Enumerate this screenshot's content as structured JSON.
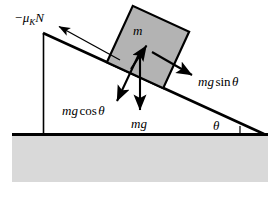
{
  "figure": {
    "type": "physics-force-diagram"
  },
  "labels": {
    "friction": {
      "minus": "−",
      "mu": "μ",
      "subscript": "K",
      "normal": "N",
      "full": "−μₖN"
    },
    "mass": "m",
    "mg_sin": {
      "mg": "mg",
      "sin": "sin",
      "theta": "θ",
      "full": "mg sin θ"
    },
    "mg_cos": {
      "mg": "mg",
      "cos": "cos",
      "theta": "θ",
      "full": "mg cos θ"
    },
    "weight": "mg",
    "angle": "θ"
  },
  "colors": {
    "stroke": "#000000",
    "block_fill": "#b3b3b3",
    "ground_fill": "#d9d9d9",
    "background": "#ffffff"
  },
  "geometry": {
    "incline_apex": [
      43,
      33
    ],
    "incline_base": [
      262,
      134
    ],
    "ground_line_y": 134,
    "ground_left_x": 12,
    "ground_right_x": 268,
    "ground_bottom_y": 182,
    "support_x": 43,
    "block_center": [
      148,
      47
    ],
    "block_size": 62,
    "block_rotation_deg": 24.7,
    "force_origin": [
      140,
      52
    ],
    "incline_angle_deg": 24.7
  }
}
